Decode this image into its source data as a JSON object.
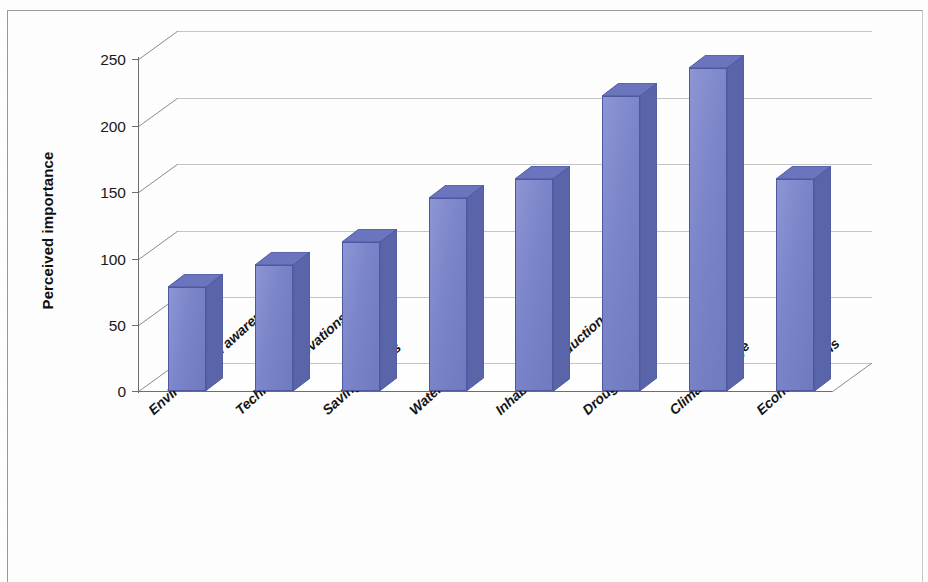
{
  "chart_data": {
    "type": "bar",
    "title": "",
    "subtitle": "",
    "xlabel": "",
    "ylabel": "Perceived importance",
    "ylim": [
      0,
      265
    ],
    "yticks": [
      0,
      50,
      100,
      150,
      200,
      250
    ],
    "ytick_labels": [
      "0",
      "50",
      "100",
      "150",
      "200",
      "250"
    ],
    "grid": true,
    "grid_axis": "y",
    "legend": false,
    "legend_position": "none",
    "style": "3d-column",
    "categories": [
      "Environmental awareness",
      "Technical Innovations",
      "Saving devices",
      "Water price",
      "Inhabitants reduction",
      "Droughts",
      "Climate change",
      "Economic crisis"
    ],
    "values": [
      78,
      95,
      112,
      145,
      160,
      222,
      243,
      160
    ],
    "series": [
      {
        "name": "Perceived importance",
        "values": [
          78,
          95,
          112,
          145,
          160,
          222,
          243,
          160
        ]
      }
    ]
  },
  "colors": {
    "bar_front": "#7b85c9",
    "bar_side": "#5a64a8",
    "bar_top": "#6b75bd",
    "bar_outline": "#4e58a0",
    "axis": "#6d6d6d",
    "gridline": "#8b8b8b",
    "text": "#161616",
    "frame": "#9a9a9a",
    "background": "#ffffff"
  },
  "axis": {
    "y_title": "Perceived importance",
    "tick_0": "0",
    "tick_50": "50",
    "tick_100": "100",
    "tick_150": "150",
    "tick_200": "200",
    "tick_250": "250"
  }
}
